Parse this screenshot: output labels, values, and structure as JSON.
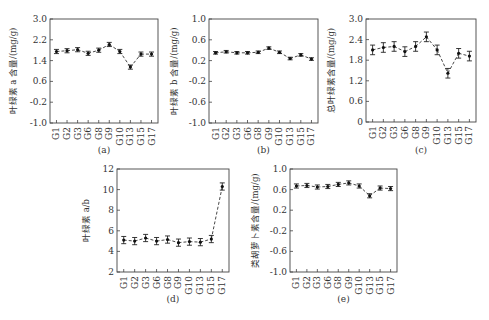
{
  "chart_data": [
    {
      "type": "line",
      "panel_label": "(a)",
      "ylabel": "叶绿素 a 含量/(mg/g)",
      "xlabel": "",
      "categories": [
        "G1",
        "G2",
        "G3",
        "G6",
        "G8",
        "G9",
        "G10",
        "G13",
        "G15",
        "G17"
      ],
      "values": [
        1.75,
        1.78,
        1.82,
        1.68,
        1.8,
        2.02,
        1.75,
        1.15,
        1.65,
        1.65
      ],
      "errors": [
        0.08,
        0.08,
        0.08,
        0.08,
        0.08,
        0.08,
        0.08,
        0.08,
        0.08,
        0.08
      ],
      "ylim": [
        -1.0,
        3.0
      ],
      "yticks": [
        -1.0,
        -0.2,
        0.6,
        1.4,
        2.2,
        3.0
      ],
      "ytick_labels": [
        "-1.0",
        "-0.2",
        "0.6",
        "1.4",
        "2.2",
        "3.0"
      ],
      "line_style": "dashed",
      "grid": false
    },
    {
      "type": "line",
      "panel_label": "(b)",
      "ylabel": "叶绿素 b 含量/(mg/g)",
      "xlabel": "",
      "categories": [
        "G1",
        "G2",
        "G3",
        "G6",
        "G8",
        "G9",
        "G10",
        "G13",
        "G15",
        "G17"
      ],
      "values": [
        0.35,
        0.37,
        0.35,
        0.35,
        0.36,
        0.44,
        0.36,
        0.24,
        0.31,
        0.23
      ],
      "errors": [
        0.025,
        0.025,
        0.025,
        0.025,
        0.025,
        0.025,
        0.025,
        0.025,
        0.025,
        0.025
      ],
      "ylim": [
        -1.0,
        1.0
      ],
      "yticks": [
        -1.0,
        -0.6,
        -0.2,
        0.2,
        0.6,
        1.0
      ],
      "ytick_labels": [
        "-1.0",
        "-0.6",
        "-0.2",
        "0.2",
        "0.6",
        "1.0"
      ],
      "line_style": "dashed",
      "grid": false
    },
    {
      "type": "line",
      "panel_label": "(c)",
      "ylabel": "总叶绿素含量/(mg/g)",
      "xlabel": "",
      "categories": [
        "G1",
        "G2",
        "G3",
        "G6",
        "G8",
        "G9",
        "G10",
        "G13",
        "G15",
        "G17"
      ],
      "values": [
        2.1,
        2.17,
        2.2,
        2.05,
        2.2,
        2.48,
        2.1,
        1.42,
        2.0,
        1.92
      ],
      "errors": [
        0.14,
        0.14,
        0.14,
        0.14,
        0.14,
        0.14,
        0.14,
        0.14,
        0.14,
        0.14
      ],
      "ylim": [
        0,
        3.0
      ],
      "yticks": [
        0,
        0.6,
        1.2,
        1.8,
        2.4,
        3.0
      ],
      "ytick_labels": [
        "0",
        "0.6",
        "1.2",
        "1.8",
        "2.4",
        "3.0"
      ],
      "line_style": "dashed",
      "grid": false
    },
    {
      "type": "line",
      "panel_label": "(d)",
      "ylabel": "叶绿素 a/b",
      "xlabel": "",
      "categories": [
        "G1",
        "G2",
        "G3",
        "G6",
        "G8",
        "G9",
        "G10",
        "G13",
        "G15",
        "G17"
      ],
      "values": [
        5.1,
        5.0,
        5.3,
        5.0,
        5.15,
        4.85,
        4.95,
        4.9,
        5.2,
        10.3
      ],
      "errors": [
        0.35,
        0.35,
        0.35,
        0.35,
        0.35,
        0.35,
        0.35,
        0.35,
        0.35,
        0.35
      ],
      "ylim": [
        2,
        12
      ],
      "yticks": [
        2,
        4,
        6,
        8,
        10,
        12
      ],
      "ytick_labels": [
        "2",
        "4",
        "6",
        "8",
        "10",
        "12"
      ],
      "line_style": "dashed",
      "grid": false
    },
    {
      "type": "line",
      "panel_label": "(e)",
      "ylabel": "类胡萝卜素含量/(mg/g)",
      "xlabel": "",
      "categories": [
        "G1",
        "G2",
        "G3",
        "G6",
        "G8",
        "G9",
        "G10",
        "G13",
        "G15",
        "G17"
      ],
      "values": [
        0.67,
        0.68,
        0.65,
        0.66,
        0.7,
        0.73,
        0.67,
        0.48,
        0.63,
        0.62
      ],
      "errors": [
        0.04,
        0.04,
        0.04,
        0.04,
        0.04,
        0.04,
        0.04,
        0.04,
        0.04,
        0.04
      ],
      "ylim": [
        -1.0,
        1.0
      ],
      "yticks": [
        -1.0,
        -0.6,
        -0.2,
        0.2,
        0.6,
        1.0
      ],
      "ytick_labels": [
        "-1.0",
        "-0.6",
        "-0.2",
        "0.2",
        "0.6",
        "1.0"
      ],
      "line_style": "dashed",
      "grid": false
    }
  ]
}
